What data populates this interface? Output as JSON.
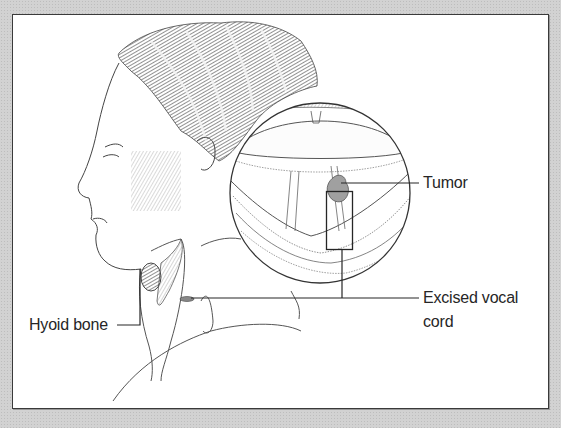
{
  "figure": {
    "labels": {
      "tumor": "Tumor",
      "excised_vocal_cord_line1": "Excised vocal",
      "excised_vocal_cord_line2": "cord",
      "hyoid_bone": "Hyoid bone"
    },
    "colors": {
      "background": "#d2d2d2",
      "panel": "#ffffff",
      "border": "#3a3a3a",
      "line": "#262626",
      "tumor": "#9a9a9a"
    }
  }
}
